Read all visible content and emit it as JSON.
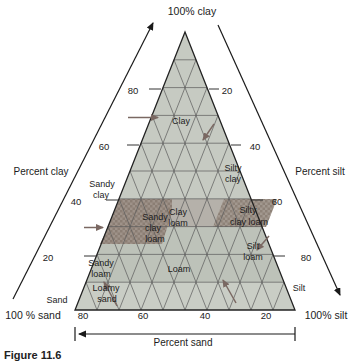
{
  "figure": {
    "caption": "Figure 11.6"
  },
  "corners": {
    "top": "100% clay",
    "bottom_left": "100 % sand",
    "bottom_right": "100% silt"
  },
  "axes": {
    "left": "Percent clay",
    "right": "Percent silt",
    "bottom": "Percent sand"
  },
  "ticks": {
    "left": [
      "80",
      "60",
      "40",
      "20"
    ],
    "right": [
      "20",
      "40",
      "60",
      "80"
    ],
    "bottom": [
      "80",
      "60",
      "40",
      "20"
    ]
  },
  "regions": {
    "clay": {
      "label": "Clay"
    },
    "silty_clay": {
      "l1": "Silty",
      "l2": "clay"
    },
    "sandy_clay": {
      "l1": "Sandy",
      "l2": "clay"
    },
    "sandy_clay_loam": {
      "l1": "Sandy",
      "l2": "clay",
      "l3": "loam"
    },
    "clay_loam": {
      "l1": "Clay",
      "l2": "loam"
    },
    "silty_clay_loam": {
      "l1": "Silty",
      "l2": "clay loam"
    },
    "silt_loam": {
      "l1": "Silt",
      "l2": "loam"
    },
    "loam": {
      "label": "Loam"
    },
    "sandy_loam": {
      "l1": "Sandy",
      "l2": "loam"
    },
    "loamy_sand": {
      "l1": "Loamy",
      "l2": "sand"
    },
    "sand": {
      "label": "Sand"
    },
    "silt": {
      "label": "Silt"
    }
  },
  "colors": {
    "triangle_base": "#c6cac2",
    "clay_loam_band": "#b5b1aa",
    "loam_band": "#bdc2b9",
    "bottom_band": "#c9cdc5",
    "dark_patch_left": "#9e9289",
    "dark_patch_right": "#a2988f",
    "grid_line": "#5a5a5a",
    "outline": "#222222",
    "arrow_accent": "#7a6862",
    "axis_line": "#1a1a1a"
  }
}
